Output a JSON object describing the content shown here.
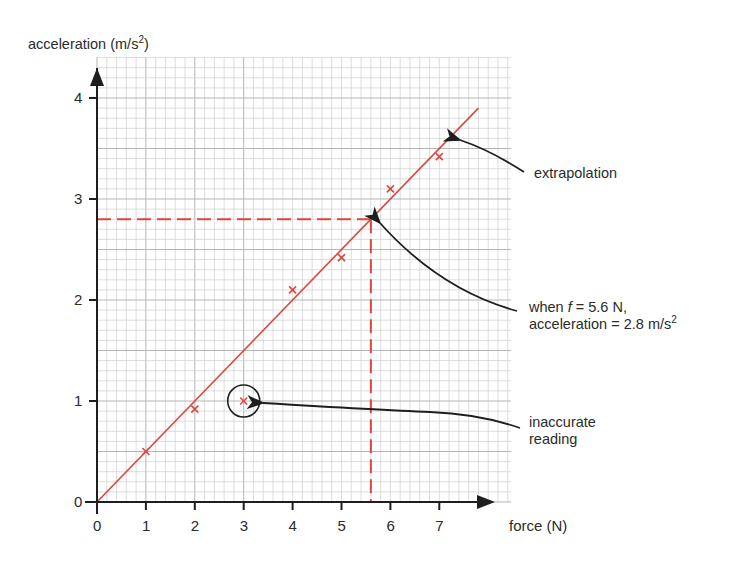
{
  "chart_data": {
    "type": "scatter",
    "title": "",
    "xlabel": "force (N)",
    "ylabel": "acceleration (m/s²)",
    "ylabel_parts": {
      "base": "acceleration (m/s",
      "sup": "2",
      "end": ")"
    },
    "xlim": [
      0,
      8
    ],
    "ylim": [
      0,
      4.4
    ],
    "x_ticks": [
      0,
      1,
      2,
      3,
      4,
      5,
      6,
      7
    ],
    "y_ticks": [
      0,
      1,
      2,
      3,
      4
    ],
    "grid": true,
    "grid_minor_x": 0.2,
    "grid_minor_y": 0.1,
    "series": [
      {
        "name": "measurements",
        "marker": "x",
        "color": "#d9473f",
        "points": [
          {
            "x": 1,
            "y": 0.5
          },
          {
            "x": 2,
            "y": 0.92
          },
          {
            "x": 3,
            "y": 1.0
          },
          {
            "x": 4,
            "y": 2.1
          },
          {
            "x": 5,
            "y": 2.42
          },
          {
            "x": 6,
            "y": 3.1
          },
          {
            "x": 7,
            "y": 3.42
          }
        ]
      },
      {
        "name": "best-fit line",
        "type": "line",
        "color": "#d9473f",
        "points": [
          {
            "x": 0,
            "y": 0
          },
          {
            "x": 7.8,
            "y": 3.9
          }
        ]
      }
    ],
    "reading": {
      "x": 5.6,
      "y": 2.8,
      "style": "dashed",
      "color": "#d9473f"
    },
    "outlier": {
      "x": 3,
      "y": 1.0
    },
    "annotations": [
      {
        "id": "extrapolation",
        "text": "extrapolation"
      },
      {
        "id": "reading",
        "line1_pre": "when ",
        "line1_var": "f",
        "line1_post": " = 5.6 N,",
        "line2_base": "acceleration = 2.8 m/s",
        "line2_sup": "2"
      },
      {
        "id": "inaccurate",
        "line1": "inaccurate",
        "line2": "reading"
      }
    ]
  },
  "colors": {
    "data": "#d9473f",
    "axis": "#1e1e1e",
    "grid": "#cfcfcf",
    "grid_major": "#b5b5b5"
  }
}
